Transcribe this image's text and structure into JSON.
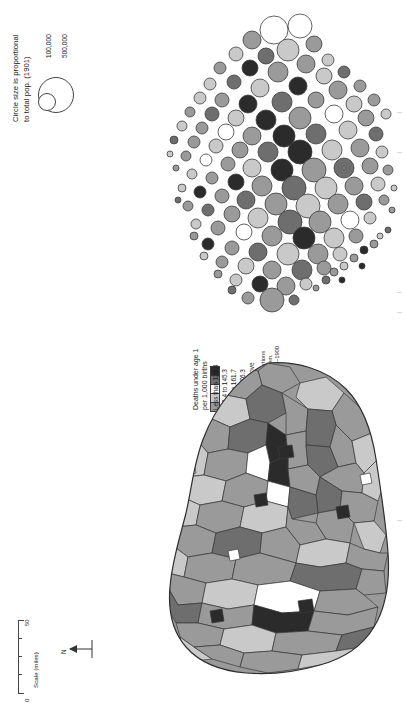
{
  "figure": {
    "type": "map-pair"
  },
  "population_legend": {
    "title_line1": "Circle size is proportional",
    "title_line2": "to total pop. (1901)",
    "circles": [
      {
        "label": "100,000",
        "radius_px": 8
      },
      {
        "label": "500,000",
        "radius_px": 17
      }
    ]
  },
  "class_legend": {
    "title_line1": "Deaths under age 1",
    "title_line2": "per 1,000 births",
    "classes": [
      {
        "label": "Less than 123.4",
        "color": "#9a9a9a"
      },
      {
        "label": "123.4 to 145.3",
        "color": "#c9c9c9"
      },
      {
        "label": "145.4 to 161.7",
        "color": "#ffffff"
      },
      {
        "label": "161.8 to 176.3",
        "color": "#6e6e6e"
      },
      {
        "label": "176.4 and above",
        "color": "#2b2b2b"
      }
    ],
    "note_line1": "Classes have equal proportions",
    "note_line2": "of the total population in them.",
    "note_line3": "Data cover the period 1891–1900"
  },
  "scale_bar": {
    "caption": "Scale (miles)",
    "min_label": "0",
    "max_label": "50",
    "tick_count": 5
  },
  "north_arrow": {
    "label": "N"
  },
  "colors": {
    "class1": "#9a9a9a",
    "class2": "#c9c9c9",
    "class3": "#ffffff",
    "class4": "#6e6e6e",
    "class5": "#2b2b2b",
    "outline": "#3a3a3a",
    "ink": "#1a1a1a"
  }
}
